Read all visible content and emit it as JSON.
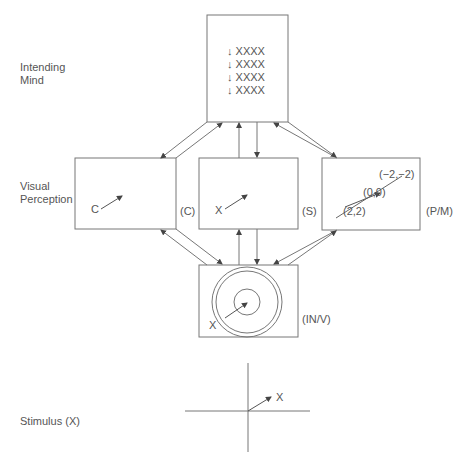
{
  "row_labels": {
    "intending_mind_line1": "Intending",
    "intending_mind_line2": "Mind",
    "visual_perception_line1": "Visual",
    "visual_perception_line2": "Perception",
    "stimulus": "Stimulus (X)"
  },
  "top_box": {
    "lines": [
      "↓ XXXX",
      "↓ XXXX",
      "↓ XXXX",
      "↓ XXXX"
    ]
  },
  "left_box": {
    "vector_label": "C",
    "side_label": "(C)"
  },
  "center_box": {
    "vector_label": "X",
    "side_label": "(S)"
  },
  "right_box": {
    "coord_top": "(−2,−2)",
    "coord_mid": "(0,0)",
    "coord_bottom": "(2,2)",
    "side_label": "(P/M)"
  },
  "bottom_box": {
    "vector_label": "X",
    "side_label": "(IN/V)"
  },
  "stimulus_axes": {
    "vector_label": "X"
  },
  "colors": {
    "line": "#777777",
    "text": "#555555",
    "arrow": "#444444"
  }
}
